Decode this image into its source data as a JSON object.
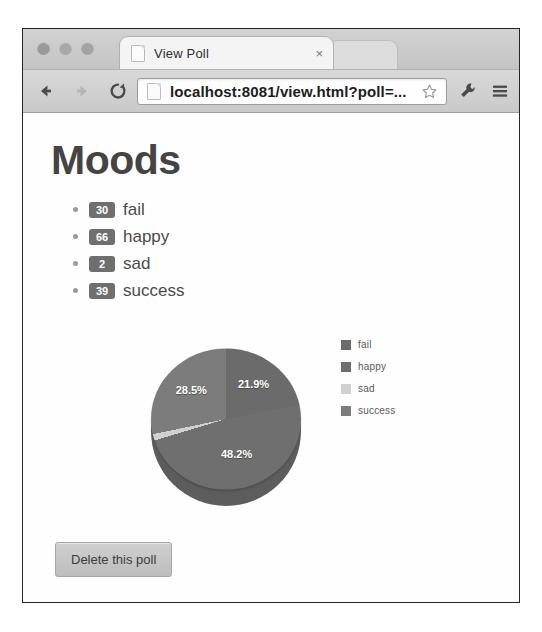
{
  "browser": {
    "tab": {
      "title": "View Poll",
      "close_label": "×",
      "favicon": "page-icon"
    },
    "toolbar": {
      "back_icon": "back-arrow-icon",
      "forward_icon": "forward-arrow-icon",
      "reload_icon": "reload-icon",
      "url": "localhost:8081/view.html?poll=...",
      "star_icon": "bookmark-star-icon",
      "wrench_icon": "wrench-icon",
      "menu_icon": "hamburger-menu-icon"
    }
  },
  "page": {
    "title": "Moods",
    "options": [
      {
        "count": "30",
        "label": "fail"
      },
      {
        "count": "66",
        "label": "happy"
      },
      {
        "count": "2",
        "label": "sad"
      },
      {
        "count": "39",
        "label": "success"
      }
    ],
    "delete_button": "Delete this poll"
  },
  "chart_data": {
    "type": "pie",
    "title": "Moods",
    "categories": [
      "fail",
      "happy",
      "sad",
      "success"
    ],
    "values": [
      30,
      66,
      2,
      39
    ],
    "total": 137,
    "percent_labels": [
      "21.9%",
      "48.2%",
      "1.5%",
      "28.5%"
    ],
    "visible_slice_labels": [
      "21.9%",
      "48.2%",
      "28.5%"
    ],
    "legend": [
      "fail",
      "happy",
      "sad",
      "success"
    ],
    "legend_position": "right",
    "colors": [
      "#6b6b6b",
      "#6f6f6f",
      "#d0d0d0",
      "#7c7c7c"
    ],
    "start_angle_deg": 0,
    "direction": "clockwise",
    "three_d": true,
    "grid": false,
    "xlabel": "",
    "ylabel": ""
  },
  "colors": {
    "badge_bg": "#6f6f6f",
    "heading": "#444444",
    "slice_fail": "#6b6b6b",
    "slice_happy": "#5f5f5f",
    "slice_sad": "#d0d0d0",
    "slice_success": "#7c7c7c"
  }
}
